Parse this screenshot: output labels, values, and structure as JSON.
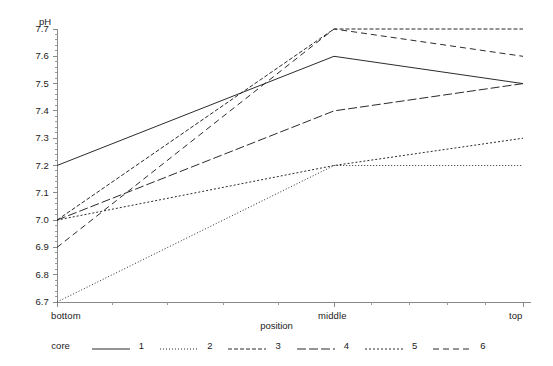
{
  "chart_data": {
    "type": "line",
    "title": "",
    "xlabel": "position",
    "ylabel": "pH",
    "categories": [
      "bottom",
      "middle",
      "top"
    ],
    "x_tick_labels": [
      "bottom",
      "middle",
      "top"
    ],
    "y_tick_labels": [
      "6.7",
      "6.8",
      "6.9",
      "7.0",
      "7.1",
      "7.2",
      "7.3",
      "7.4",
      "7.5",
      "7.6",
      "7.7"
    ],
    "ylim": [
      6.7,
      7.7
    ],
    "y_tick_step": 0.1,
    "y_minor_ticks_per_major": 5,
    "grid": false,
    "legend_position": "bottom",
    "legend_title": "core",
    "series": [
      {
        "name": "1",
        "values": [
          7.2,
          7.6,
          7.5
        ],
        "style": "solid",
        "dash": "none"
      },
      {
        "name": "2",
        "values": [
          6.7,
          7.2,
          7.2
        ],
        "style": "fine-dotted",
        "dash": "1,2"
      },
      {
        "name": "3",
        "values": [
          7.0,
          7.7,
          7.7
        ],
        "style": "short-dashed",
        "dash": "4,2"
      },
      {
        "name": "4",
        "values": [
          7.0,
          7.4,
          7.5
        ],
        "style": "long-dashed",
        "dash": "9,3"
      },
      {
        "name": "5",
        "values": [
          7.0,
          7.2,
          7.3
        ],
        "style": "dotted",
        "dash": "2,2"
      },
      {
        "name": "6",
        "values": [
          6.9,
          7.7,
          7.6
        ],
        "style": "dashed",
        "dash": "6,4"
      }
    ]
  },
  "axes": {
    "y_axis_label": "pH",
    "x_axis_label": "position"
  },
  "legend": {
    "title": "core",
    "entries": [
      {
        "label": "1"
      },
      {
        "label": "2"
      },
      {
        "label": "3"
      },
      {
        "label": "4"
      },
      {
        "label": "5"
      },
      {
        "label": "6"
      }
    ]
  },
  "colors": {
    "line": "#2b2b2b",
    "axis": "#8a8a8a",
    "text": "#1b1b1b",
    "background": "#ffffff"
  },
  "top_strip": {
    "text": ""
  }
}
